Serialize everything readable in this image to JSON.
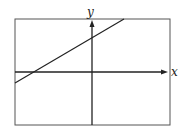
{
  "diagram": {
    "type": "coordinate-plane-with-line",
    "axes": {
      "x_label": "x",
      "y_label": "y"
    },
    "line": {
      "description": "straight line with positive slope",
      "slope_sign": "positive",
      "y_intercept_sign": "positive",
      "x_intercept_sign": "negative"
    },
    "colors": {
      "stroke": "#222222",
      "frame": "#555555",
      "background": "#ffffff"
    }
  }
}
